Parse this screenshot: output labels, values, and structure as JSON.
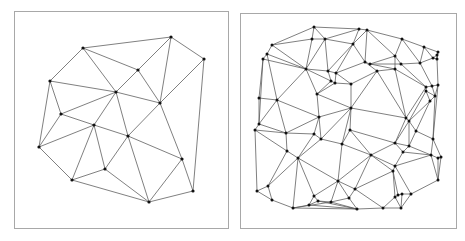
{
  "figure": {
    "width": 465,
    "height": 241,
    "colors": {
      "frame": "#a8a8a8",
      "edge": "#555555",
      "vertex": "#111111",
      "background": "#ffffff"
    },
    "panels": [
      {
        "name": "coarse-triangulation",
        "frame": {
          "x": 14,
          "y": 11,
          "w": 214,
          "h": 217
        },
        "vertices": [
          [
            83,
            48
          ],
          [
            171,
            37
          ],
          [
            204,
            59
          ],
          [
            138,
            70
          ],
          [
            50,
            81
          ],
          [
            116,
            92
          ],
          [
            160,
            103
          ],
          [
            61,
            114
          ],
          [
            94,
            125
          ],
          [
            128,
            136
          ],
          [
            39,
            147
          ],
          [
            182,
            159
          ],
          [
            105,
            169
          ],
          [
            72,
            180
          ],
          [
            193,
            191
          ],
          [
            149,
            202
          ]
        ],
        "edges": [
          [
            0,
            1
          ],
          [
            0,
            4
          ],
          [
            0,
            5
          ],
          [
            0,
            3
          ],
          [
            1,
            3
          ],
          [
            1,
            6
          ],
          [
            1,
            2
          ],
          [
            2,
            6
          ],
          [
            2,
            14
          ],
          [
            3,
            5
          ],
          [
            3,
            6
          ],
          [
            4,
            5
          ],
          [
            4,
            7
          ],
          [
            4,
            10
          ],
          [
            5,
            7
          ],
          [
            5,
            8
          ],
          [
            5,
            9
          ],
          [
            5,
            6
          ],
          [
            6,
            9
          ],
          [
            6,
            11
          ],
          [
            7,
            8
          ],
          [
            7,
            10
          ],
          [
            8,
            10
          ],
          [
            8,
            13
          ],
          [
            8,
            12
          ],
          [
            8,
            9
          ],
          [
            9,
            12
          ],
          [
            9,
            15
          ],
          [
            9,
            11
          ],
          [
            10,
            13
          ],
          [
            11,
            14
          ],
          [
            11,
            15
          ],
          [
            12,
            13
          ],
          [
            12,
            15
          ],
          [
            13,
            15
          ],
          [
            14,
            15
          ]
        ]
      },
      {
        "name": "fine-triangulation",
        "frame": {
          "x": 240,
          "y": 13,
          "w": 216,
          "h": 215
        },
        "vertices": [
          [
            314,
            27
          ],
          [
            325,
            39
          ],
          [
            312,
            39
          ],
          [
            272,
            45
          ],
          [
            267,
            54
          ],
          [
            263,
            59
          ],
          [
            306,
            69
          ],
          [
            328,
            71
          ],
          [
            336,
            73
          ],
          [
            331,
            81
          ],
          [
            335,
            83
          ],
          [
            317,
            94
          ],
          [
            259,
            98
          ],
          [
            277,
            100
          ],
          [
            319,
            117
          ],
          [
            259,
            124
          ],
          [
            255,
            130
          ],
          [
            286,
            133
          ],
          [
            314,
            134
          ],
          [
            321,
            139
          ],
          [
            342,
            144
          ],
          [
            287,
            151
          ],
          [
            298,
            158
          ],
          [
            338,
            181
          ],
          [
            268,
            186
          ],
          [
            257,
            191
          ],
          [
            272,
            200
          ],
          [
            314,
            196
          ],
          [
            318,
            201
          ],
          [
            331,
            202
          ],
          [
            309,
            205
          ],
          [
            293,
            208
          ],
          [
            359,
            29
          ],
          [
            367,
            30
          ],
          [
            402,
            39
          ],
          [
            353,
            44
          ],
          [
            424,
            47
          ],
          [
            438,
            52
          ],
          [
            437,
            55
          ],
          [
            433,
            58
          ],
          [
            437,
            59
          ],
          [
            395,
            56
          ],
          [
            365,
            62
          ],
          [
            370,
            64
          ],
          [
            401,
            64
          ],
          [
            420,
            63
          ],
          [
            395,
            69
          ],
          [
            377,
            71
          ],
          [
            351,
            84
          ],
          [
            426,
            87
          ],
          [
            432,
            86
          ],
          [
            438,
            85
          ],
          [
            426,
            91
          ],
          [
            435,
            96
          ],
          [
            430,
            101
          ],
          [
            351,
            108
          ],
          [
            406,
            118
          ],
          [
            409,
            121
          ],
          [
            416,
            131
          ],
          [
            350,
            130
          ],
          [
            433,
            139
          ],
          [
            395,
            143
          ],
          [
            409,
            146
          ],
          [
            403,
            152
          ],
          [
            371,
            155
          ],
          [
            431,
            155
          ],
          [
            438,
            158
          ],
          [
            441,
            157
          ],
          [
            395,
            166
          ],
          [
            393,
            171
          ],
          [
            438,
            180
          ],
          [
            355,
            189
          ],
          [
            411,
            194
          ],
          [
            398,
            195
          ],
          [
            402,
            194
          ],
          [
            349,
            198
          ],
          [
            395,
            197
          ],
          [
            357,
            209
          ],
          [
            383,
            208
          ],
          [
            401,
            208
          ]
        ],
        "edges": [
          [
            0,
            32
          ],
          [
            0,
            2
          ],
          [
            0,
            1
          ],
          [
            0,
            3
          ],
          [
            2,
            3
          ],
          [
            1,
            2
          ],
          [
            1,
            32
          ],
          [
            1,
            35
          ],
          [
            1,
            6
          ],
          [
            2,
            6
          ],
          [
            3,
            4
          ],
          [
            3,
            6
          ],
          [
            4,
            5
          ],
          [
            4,
            6
          ],
          [
            5,
            12
          ],
          [
            5,
            6
          ],
          [
            5,
            15
          ],
          [
            32,
            33
          ],
          [
            32,
            35
          ],
          [
            33,
            35
          ],
          [
            33,
            42
          ],
          [
            33,
            34
          ],
          [
            34,
            36
          ],
          [
            34,
            41
          ],
          [
            33,
            41
          ],
          [
            35,
            42
          ],
          [
            35,
            8
          ],
          [
            35,
            7
          ],
          [
            1,
            7
          ],
          [
            6,
            7
          ],
          [
            7,
            8
          ],
          [
            7,
            9
          ],
          [
            6,
            9
          ],
          [
            6,
            11
          ],
          [
            6,
            13
          ],
          [
            4,
            13
          ],
          [
            8,
            42
          ],
          [
            8,
            10
          ],
          [
            9,
            10
          ],
          [
            9,
            11
          ],
          [
            10,
            11
          ],
          [
            10,
            48
          ],
          [
            8,
            48
          ],
          [
            42,
            43
          ],
          [
            42,
            47
          ],
          [
            43,
            41
          ],
          [
            43,
            44
          ],
          [
            41,
            44
          ],
          [
            41,
            46
          ],
          [
            43,
            46
          ],
          [
            46,
            47
          ],
          [
            47,
            48
          ],
          [
            36,
            37
          ],
          [
            36,
            39
          ],
          [
            36,
            45
          ],
          [
            34,
            45
          ],
          [
            44,
            45
          ],
          [
            45,
            39
          ],
          [
            37,
            38
          ],
          [
            38,
            39
          ],
          [
            38,
            40
          ],
          [
            39,
            40
          ],
          [
            37,
            40
          ],
          [
            45,
            50
          ],
          [
            44,
            49
          ],
          [
            46,
            49
          ],
          [
            49,
            50
          ],
          [
            50,
            51
          ],
          [
            40,
            51
          ],
          [
            51,
            53
          ],
          [
            50,
            53
          ],
          [
            49,
            52
          ],
          [
            52,
            53
          ],
          [
            52,
            54
          ],
          [
            53,
            54
          ],
          [
            47,
            55
          ],
          [
            48,
            55
          ],
          [
            46,
            56
          ],
          [
            47,
            56
          ],
          [
            49,
            56
          ],
          [
            52,
            57
          ],
          [
            54,
            57
          ],
          [
            56,
            57
          ],
          [
            54,
            58
          ],
          [
            57,
            58
          ],
          [
            51,
            60
          ],
          [
            53,
            60
          ],
          [
            58,
            60
          ],
          [
            11,
            55
          ],
          [
            11,
            14
          ],
          [
            13,
            14
          ],
          [
            12,
            13
          ],
          [
            12,
            15
          ],
          [
            13,
            15
          ],
          [
            15,
            16
          ],
          [
            14,
            17
          ],
          [
            13,
            17
          ],
          [
            15,
            17
          ],
          [
            16,
            17
          ],
          [
            14,
            18
          ],
          [
            17,
            18
          ],
          [
            18,
            19
          ],
          [
            14,
            19
          ],
          [
            14,
            55
          ],
          [
            19,
            55
          ],
          [
            19,
            20
          ],
          [
            55,
            20
          ],
          [
            55,
            59
          ],
          [
            20,
            59
          ],
          [
            55,
            56
          ],
          [
            17,
            21
          ],
          [
            16,
            21
          ],
          [
            18,
            22
          ],
          [
            21,
            22
          ],
          [
            19,
            22
          ],
          [
            16,
            25
          ],
          [
            21,
            24
          ],
          [
            24,
            25
          ],
          [
            21,
            24
          ],
          [
            22,
            23
          ],
          [
            20,
            23
          ],
          [
            22,
            24
          ],
          [
            24,
            26
          ],
          [
            25,
            26
          ],
          [
            26,
            31
          ],
          [
            22,
            31
          ],
          [
            22,
            27
          ],
          [
            23,
            27
          ],
          [
            27,
            28
          ],
          [
            28,
            29
          ],
          [
            23,
            29
          ],
          [
            27,
            30
          ],
          [
            30,
            31
          ],
          [
            28,
            30
          ],
          [
            29,
            31
          ],
          [
            59,
            61
          ],
          [
            56,
            61
          ],
          [
            57,
            61
          ],
          [
            57,
            62
          ],
          [
            58,
            62
          ],
          [
            61,
            62
          ],
          [
            62,
            63
          ],
          [
            61,
            63
          ],
          [
            58,
            60
          ],
          [
            62,
            65
          ],
          [
            60,
            65
          ],
          [
            65,
            66
          ],
          [
            66,
            67
          ],
          [
            60,
            67
          ],
          [
            59,
            64
          ],
          [
            20,
            64
          ],
          [
            61,
            64
          ],
          [
            63,
            68
          ],
          [
            64,
            68
          ],
          [
            63,
            65
          ],
          [
            65,
            68
          ],
          [
            68,
            69
          ],
          [
            64,
            69
          ],
          [
            65,
            70
          ],
          [
            66,
            70
          ],
          [
            67,
            70
          ],
          [
            23,
            64
          ],
          [
            23,
            71
          ],
          [
            64,
            71
          ],
          [
            69,
            71
          ],
          [
            69,
            76
          ],
          [
            69,
            73
          ],
          [
            68,
            72
          ],
          [
            70,
            72
          ],
          [
            72,
            74
          ],
          [
            73,
            74
          ],
          [
            73,
            76
          ],
          [
            71,
            75
          ],
          [
            23,
            75
          ],
          [
            29,
            75
          ],
          [
            75,
            77
          ],
          [
            29,
            77
          ],
          [
            71,
            78
          ],
          [
            76,
            78
          ],
          [
            77,
            78
          ],
          [
            78,
            79
          ],
          [
            76,
            79
          ],
          [
            74,
            79
          ],
          [
            72,
            79
          ],
          [
            31,
            77
          ],
          [
            30,
            77
          ],
          [
            28,
            77
          ]
        ]
      }
    ]
  }
}
